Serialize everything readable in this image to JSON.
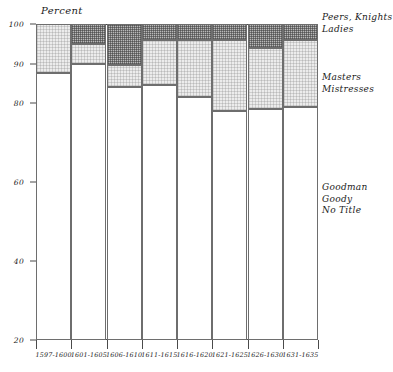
{
  "chart_data": {
    "type": "bar",
    "subtype": "stacked-percentage",
    "title": "",
    "ylabel": "Percent",
    "xlabel": "",
    "ylim": [
      20,
      100
    ],
    "grid": false,
    "legend_position": "right",
    "categories": [
      "1597-1600",
      "1601-1605",
      "1606-1610",
      "1611-1615",
      "1616-1620",
      "1621-1625",
      "1626-1630",
      "1631-1635"
    ],
    "ytick_labels": [
      "100",
      "90",
      "80",
      "60",
      "40",
      "20"
    ],
    "ytick_values": [
      100,
      90,
      80,
      60,
      40,
      20
    ],
    "series": [
      {
        "name": "Goodman Goody No Title",
        "legend_lines": [
          "Goodman",
          "Goody",
          "No Title"
        ],
        "fill": "white",
        "values": [
          87.5,
          90,
          84,
          84.5,
          81.5,
          78,
          78.5,
          79
        ]
      },
      {
        "name": "Masters Mistresses",
        "legend_lines": [
          "Masters",
          "Mistresses"
        ],
        "fill": "light-stipple",
        "values": [
          12.5,
          5,
          5.5,
          11.5,
          14.5,
          18,
          15.5,
          17
        ]
      },
      {
        "name": "Peers, Knights Ladies",
        "legend_lines": [
          "Peers, Knights",
          "Ladies"
        ],
        "fill": "dark-stipple",
        "values": [
          0,
          5,
          10.5,
          4,
          4,
          4,
          6,
          4
        ]
      }
    ],
    "segment_tops": {
      "goodman_top": [
        87.5,
        90,
        84,
        84.5,
        81.5,
        78,
        78.5,
        79
      ],
      "masters_top": [
        100,
        95,
        89.5,
        96,
        96,
        96,
        94,
        96
      ],
      "peers_top": [
        100,
        100,
        100,
        100,
        100,
        100,
        100,
        100
      ]
    }
  },
  "legend": {
    "top": {
      "line1": "Peers, Knights",
      "line2": "Ladies"
    },
    "middle": {
      "line1": "Masters",
      "line2": "Mistresses"
    },
    "bottom": {
      "line1": "Goodman",
      "line2": "Goody",
      "line3": "No Title"
    }
  }
}
